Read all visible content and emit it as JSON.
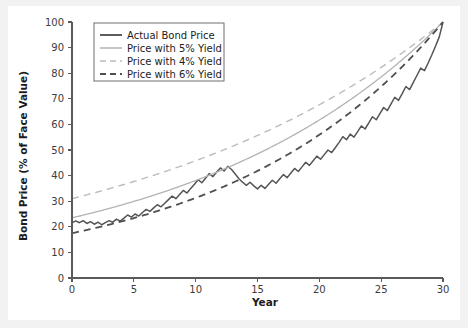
{
  "chart_data": {
    "type": "line",
    "title": "",
    "xlabel": "Year",
    "ylabel": "Bond Price (% of Face Value)",
    "xlim": [
      0,
      30
    ],
    "ylim": [
      0,
      100
    ],
    "xticks": [
      0,
      5,
      10,
      15,
      20,
      25,
      30
    ],
    "yticks": [
      0,
      10,
      20,
      30,
      40,
      50,
      60,
      70,
      80,
      90,
      100
    ],
    "grid": false,
    "legend_position": "upper-left",
    "series": [
      {
        "name": "Actual Bond Price",
        "style": "solid",
        "color": "#555555",
        "width": 1.5,
        "x": [
          0,
          0.3,
          0.6,
          0.9,
          1.2,
          1.5,
          1.8,
          2.1,
          2.4,
          2.7,
          3.0,
          3.3,
          3.6,
          3.9,
          4.2,
          4.5,
          4.8,
          5.1,
          5.4,
          5.7,
          6.0,
          6.3,
          6.6,
          6.9,
          7.2,
          7.5,
          7.8,
          8.1,
          8.4,
          8.7,
          9.0,
          9.3,
          9.6,
          9.9,
          10.2,
          10.5,
          10.8,
          11.1,
          11.4,
          11.7,
          12.0,
          12.3,
          12.6,
          12.9,
          13.2,
          13.5,
          13.8,
          14.1,
          14.4,
          14.7,
          15.0,
          15.3,
          15.6,
          15.9,
          16.2,
          16.5,
          16.8,
          17.1,
          17.4,
          17.7,
          18.0,
          18.3,
          18.6,
          18.9,
          19.2,
          19.5,
          19.8,
          20.1,
          20.4,
          20.7,
          21.0,
          21.3,
          21.6,
          21.9,
          22.2,
          22.5,
          22.8,
          23.1,
          23.4,
          23.7,
          24.0,
          24.3,
          24.6,
          24.9,
          25.2,
          25.5,
          25.8,
          26.1,
          26.4,
          26.7,
          27.0,
          27.3,
          27.6,
          27.9,
          28.2,
          28.5,
          28.8,
          29.1,
          29.4,
          29.7,
          30.0
        ],
        "y": [
          21.5,
          22.3,
          21.6,
          22.4,
          21.3,
          22.0,
          21.0,
          21.8,
          20.8,
          21.6,
          22.4,
          21.8,
          23.0,
          22.2,
          23.4,
          24.6,
          23.8,
          25.0,
          24.2,
          25.6,
          26.8,
          26.0,
          27.4,
          28.6,
          27.8,
          29.2,
          30.6,
          32.0,
          31.0,
          32.6,
          34.2,
          33.2,
          35.0,
          36.6,
          38.4,
          37.2,
          39.0,
          40.8,
          39.6,
          41.4,
          43.0,
          41.8,
          43.6,
          42.4,
          40.6,
          38.8,
          37.4,
          36.2,
          37.4,
          36.0,
          34.8,
          36.2,
          35.0,
          36.6,
          38.2,
          37.0,
          38.8,
          40.4,
          39.2,
          41.0,
          42.8,
          41.6,
          43.4,
          45.2,
          44.0,
          45.8,
          47.6,
          46.4,
          48.2,
          50.0,
          49.0,
          51.0,
          53.0,
          55.2,
          54.0,
          56.2,
          55.0,
          57.2,
          59.4,
          58.2,
          60.6,
          63.0,
          61.8,
          64.2,
          66.6,
          65.4,
          68.0,
          70.6,
          69.4,
          72.0,
          74.8,
          73.6,
          76.4,
          79.2,
          82.0,
          81.0,
          84.0,
          87.2,
          90.6,
          94.2,
          100.0
        ]
      },
      {
        "name": "Price with 5% Yield",
        "style": "solid",
        "color": "#b3b3b3",
        "width": 1.3,
        "y0": 23.5,
        "rate": 0.05
      },
      {
        "name": "Price with 4% Yield",
        "style": "dashed",
        "color": "#bcbcbc",
        "width": 1.4,
        "y0": 31.0,
        "rate": 0.04
      },
      {
        "name": "Price with 6% Yield",
        "style": "dashed",
        "color": "#4f4f4f",
        "width": 1.8,
        "y0": 17.5,
        "rate": 0.06
      }
    ],
    "legend": [
      {
        "label": "Actual Bond Price",
        "style": "solid",
        "color": "#555555",
        "width": 1.9
      },
      {
        "label": "Price with 5% Yield",
        "style": "solid",
        "color": "#b3b3b3",
        "width": 1.5
      },
      {
        "label": "Price with 4% Yield",
        "style": "dashed",
        "color": "#bcbcbc",
        "width": 1.5
      },
      {
        "label": "Price with 6% Yield",
        "style": "dashed",
        "color": "#4f4f4f",
        "width": 1.9
      }
    ]
  }
}
